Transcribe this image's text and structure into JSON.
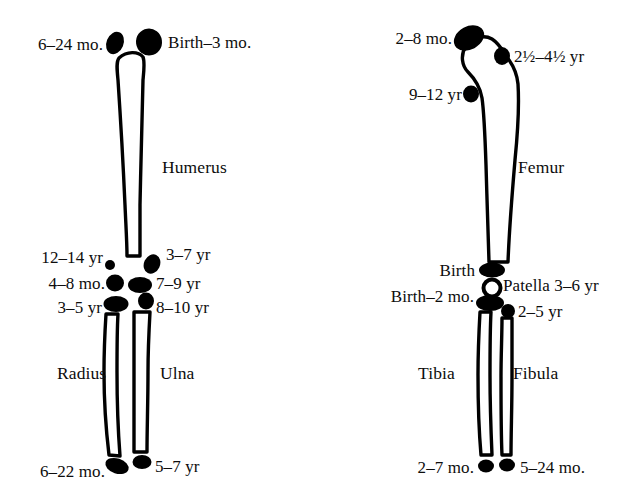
{
  "figure": {
    "background_color": "#ffffff",
    "ink_color": "#000000"
  },
  "upper_limb": {
    "bones": {
      "humerus": "Humerus",
      "radius": "Radius",
      "ulna": "Ulna"
    },
    "labels": {
      "humeral_head_lateral": "6–24 mo.",
      "humeral_head_medial": "Birth–3 mo.",
      "medial_epicondyle": "12–14 yr",
      "lateral_epicondyle": "3–7 yr",
      "capitellum": "4–8 mo.",
      "trochlea": "7–9 yr",
      "radial_head": "3–5 yr",
      "olecranon": "8–10 yr",
      "distal_radius": "6–22 mo.",
      "distal_ulna": "5–7 yr"
    }
  },
  "lower_limb": {
    "bones": {
      "femur": "Femur",
      "tibia": "Tibia",
      "fibula": "Fibula"
    },
    "labels": {
      "femoral_head": "2–8 mo.",
      "greater_trochanter": "2½–4½ yr",
      "lesser_trochanter": "9–12 yr",
      "distal_femur": "Birth",
      "patella": "Patella 3–6 yr",
      "proximal_tibia": "Birth–2 mo.",
      "proximal_fibula": "2–5 yr",
      "distal_tibia": "2–7 mo.",
      "distal_fibula": "5–24 mo."
    }
  }
}
